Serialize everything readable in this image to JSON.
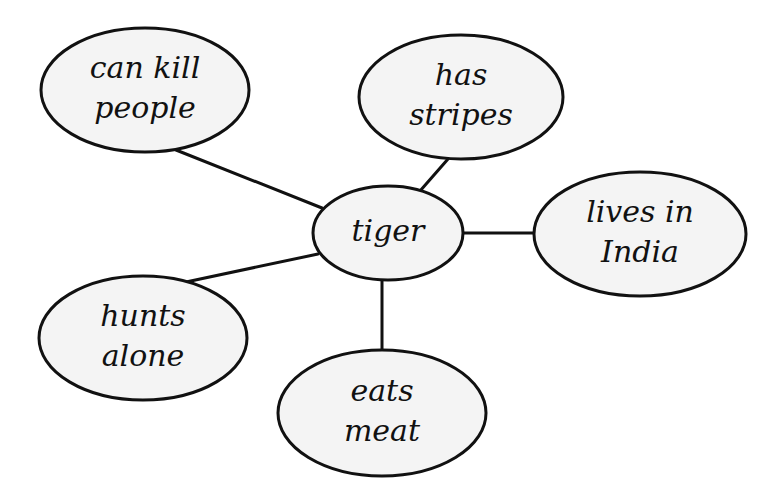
{
  "diagram": {
    "type": "concept-web",
    "center": {
      "id": "tiger",
      "lines": [
        "tiger"
      ]
    },
    "nodes": [
      {
        "id": "can-kill-people",
        "lines": [
          "can kill",
          "people"
        ]
      },
      {
        "id": "has-stripes",
        "lines": [
          "has",
          "stripes"
        ]
      },
      {
        "id": "lives-in-india",
        "lines": [
          "lives in",
          "India"
        ]
      },
      {
        "id": "hunts-alone",
        "lines": [
          "hunts",
          "alone"
        ]
      },
      {
        "id": "eats-meat",
        "lines": [
          "eats",
          "meat"
        ]
      }
    ],
    "edges": [
      {
        "from": "tiger",
        "to": "can-kill-people"
      },
      {
        "from": "tiger",
        "to": "has-stripes"
      },
      {
        "from": "tiger",
        "to": "lives-in-india"
      },
      {
        "from": "tiger",
        "to": "hunts-alone"
      },
      {
        "from": "tiger",
        "to": "eats-meat"
      }
    ],
    "colors": {
      "stroke": "#111111",
      "fill": "#f4f4f4",
      "background": "#ffffff"
    }
  }
}
